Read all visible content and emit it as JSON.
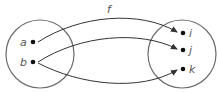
{
  "diagram": {
    "type": "function-mapping",
    "function_label": "f",
    "domain_set": {
      "elements": [
        {
          "label": "a",
          "x": 33,
          "y": 42
        },
        {
          "label": "b",
          "x": 33,
          "y": 62
        }
      ]
    },
    "codomain_set": {
      "elements": [
        {
          "label": "i",
          "x": 183,
          "y": 33
        },
        {
          "label": "j",
          "x": 183,
          "y": 50
        },
        {
          "label": "k",
          "x": 183,
          "y": 69
        }
      ]
    },
    "mappings": [
      {
        "from": "a",
        "to": "i"
      },
      {
        "from": "b",
        "to": "j"
      },
      {
        "from": "b",
        "to": "k"
      }
    ],
    "colors": {
      "set_outline": "#6b6b6b",
      "arrow": "#333333",
      "dot": "#111111",
      "label": "#555555"
    }
  }
}
